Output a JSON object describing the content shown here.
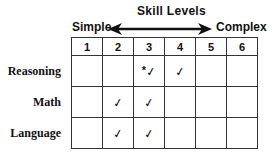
{
  "title": "Skill Levels",
  "scale": {
    "left_label": "Simple",
    "right_label": "Complex"
  },
  "columns": [
    "1",
    "2",
    "3",
    "4",
    "5",
    "6"
  ],
  "rows": [
    {
      "label": "Reasoning",
      "cells": [
        "",
        "",
        "*✓",
        "✓",
        "",
        ""
      ]
    },
    {
      "label": "Math",
      "cells": [
        "",
        "✓",
        "✓",
        "",
        "",
        ""
      ]
    },
    {
      "label": "Language",
      "cells": [
        "",
        "✓",
        "✓",
        "",
        "",
        ""
      ]
    }
  ],
  "marks": {
    "check": "✓",
    "star": "*"
  }
}
